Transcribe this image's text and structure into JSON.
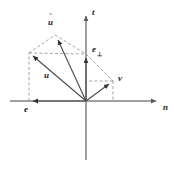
{
  "figure": {
    "background_color": "#ffffff",
    "line_color": "#4d4d4d",
    "axis_color": "#808080",
    "dash_color": "#8c8c8c",
    "label_color": "#1a1a1a",
    "width": 174,
    "height": 175
  },
  "axes": {
    "horizontal": {
      "name": "n-axis",
      "label": "n",
      "origin_x": 86,
      "y": 101,
      "x_start": 10,
      "x_end": 160,
      "arrow": "right"
    },
    "vertical": {
      "name": "t-axis",
      "label": "t",
      "x": 86,
      "y_start": 12,
      "y_end": 160,
      "arrow": "up"
    }
  },
  "origin": {
    "x": 86,
    "y": 101
  },
  "vectors": [
    {
      "id": "e",
      "label": "e",
      "from": {
        "x": 86,
        "y": 101
      },
      "to": {
        "x": 29,
        "y": 101
      },
      "style": "solid",
      "arrow": true,
      "label_pos": {
        "x": 25,
        "y": 105
      }
    },
    {
      "id": "e-perp",
      "label": "e",
      "sublabel": "⊥",
      "from": {
        "x": 86,
        "y": 101
      },
      "to": {
        "x": 86,
        "y": 54
      },
      "style": "solid",
      "arrow": true,
      "label_pos": {
        "x": 92,
        "y": 47
      }
    },
    {
      "id": "u",
      "label": "u",
      "from": {
        "x": 86,
        "y": 101
      },
      "to": {
        "x": 29,
        "y": 53
      },
      "style": "solid",
      "arrow": true,
      "label_pos": {
        "x": 45,
        "y": 72
      }
    },
    {
      "id": "u-tilde",
      "label": "u",
      "overmark": "˜",
      "from": {
        "x": 86,
        "y": 101
      },
      "to": {
        "x": 55,
        "y": 35
      },
      "style": "solid",
      "arrow": true,
      "label_pos": {
        "x": 48,
        "y": 19
      }
    },
    {
      "id": "v",
      "label": "v",
      "from": {
        "x": 86,
        "y": 101
      },
      "to": {
        "x": 113,
        "y": 81
      },
      "style": "solid",
      "arrow": true,
      "label_pos": {
        "x": 118,
        "y": 78
      }
    }
  ],
  "construction_lines": [
    {
      "id": "e-to-u",
      "from": {
        "x": 29,
        "y": 101
      },
      "to": {
        "x": 29,
        "y": 53
      },
      "style": "dashed"
    },
    {
      "id": "u-to-utilde",
      "from": {
        "x": 29,
        "y": 53
      },
      "to": {
        "x": 55,
        "y": 35
      },
      "style": "dashed"
    },
    {
      "id": "utilde-to-eperp",
      "from": {
        "x": 55,
        "y": 35
      },
      "to": {
        "x": 86,
        "y": 54
      },
      "style": "dashed"
    },
    {
      "id": "u-to-eperp",
      "from": {
        "x": 29,
        "y": 53
      },
      "to": {
        "x": 86,
        "y": 54
      },
      "style": "dashed"
    },
    {
      "id": "eperp-to-v",
      "from": {
        "x": 86,
        "y": 54
      },
      "to": {
        "x": 113,
        "y": 81
      },
      "style": "dashed"
    },
    {
      "id": "v-to-axis",
      "from": {
        "x": 113,
        "y": 81
      },
      "to": {
        "x": 113,
        "y": 101
      },
      "style": "dashed"
    },
    {
      "id": "v-to-taxis",
      "from": {
        "x": 113,
        "y": 81
      },
      "to": {
        "x": 86,
        "y": 81
      },
      "style": "dashed"
    }
  ]
}
